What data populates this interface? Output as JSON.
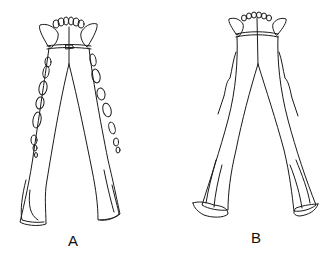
{
  "figure": {
    "panels": [
      {
        "id": "A",
        "label": "A"
      },
      {
        "id": "B",
        "label": "B"
      }
    ],
    "stroke_color": "#1a1a1a",
    "background_color": "#ffffff"
  }
}
